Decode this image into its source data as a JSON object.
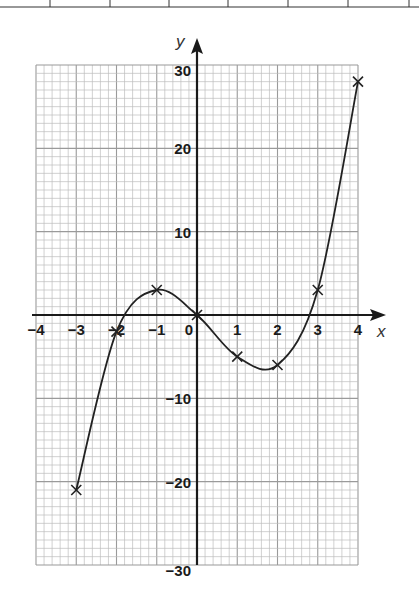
{
  "chart_data": {
    "type": "line",
    "title": "",
    "xlabel": "x",
    "ylabel": "y",
    "xlim": [
      -4,
      4
    ],
    "ylim": [
      -30,
      30
    ],
    "grid": true,
    "x_ticks": [
      -4,
      -3,
      -2,
      -1,
      0,
      1,
      2,
      3,
      4
    ],
    "x_tick_labels": [
      "−4",
      "−3",
      "−2",
      "−1",
      "0",
      "1",
      "2",
      "3",
      "4"
    ],
    "y_ticks": [
      30,
      20,
      10,
      -10,
      -20,
      -30
    ],
    "y_tick_labels": [
      "30",
      "20",
      "10",
      "−10",
      "−20",
      "−30"
    ],
    "series": [
      {
        "name": "plotted points",
        "marker": "x",
        "x": [
          -3,
          -2,
          -1,
          0,
          1,
          2,
          3,
          4
        ],
        "values": [
          -21,
          -2,
          3,
          0,
          -5,
          -6,
          3,
          28
        ]
      }
    ],
    "curve": "smooth curve through points",
    "colors": {
      "grid_minor": "#bdbdbd",
      "grid_major": "#9a9a9a",
      "axis": "#1a1a1a",
      "curve": "#222222"
    }
  },
  "header_table": {
    "visible_partial_row": true,
    "column_count": 8
  }
}
